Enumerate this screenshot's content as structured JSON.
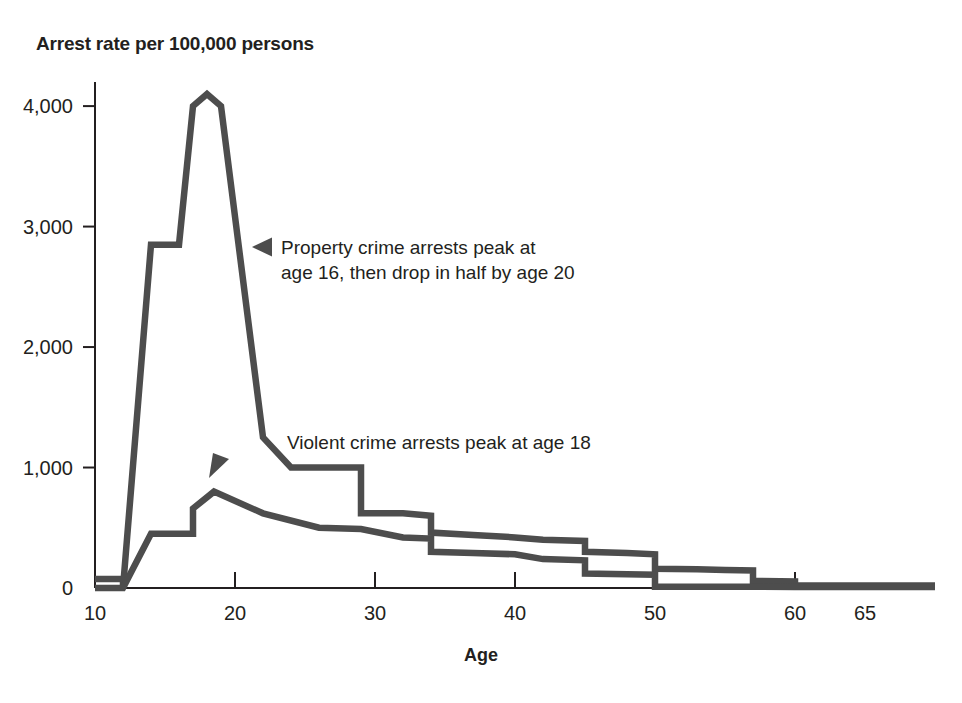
{
  "chart_data": {
    "type": "line",
    "title": "Arrest rate per 100,000 persons",
    "xlabel": "Age",
    "ylabel": "Arrest rate per 100,000 persons",
    "xlim": [
      10,
      70
    ],
    "ylim": [
      0,
      4200
    ],
    "grid": false,
    "legend": "none",
    "x_ticks": [
      10,
      20,
      30,
      40,
      50,
      60,
      65
    ],
    "x_tick_labels": [
      "10",
      "20",
      "30",
      "40",
      "50",
      "60",
      "65"
    ],
    "y_ticks": [
      0,
      1000,
      2000,
      3000,
      4000
    ],
    "y_tick_labels": [
      "0",
      "1,000",
      "2,000",
      "3,000",
      "4,000"
    ],
    "line_color": "#4d4d4d",
    "axis_color": "#231f20",
    "series": [
      {
        "name": "Property crime arrests",
        "x": [
          10,
          12,
          12,
          14,
          16,
          17,
          18,
          19,
          22,
          24,
          29,
          29,
          32,
          34,
          34,
          37,
          40,
          42,
          45,
          45,
          48,
          50,
          50,
          53,
          55,
          57,
          57,
          60,
          60,
          70
        ],
        "values": [
          75,
          75,
          0,
          2850,
          2850,
          4000,
          4100,
          4000,
          1250,
          1000,
          1000,
          620,
          620,
          600,
          460,
          440,
          420,
          400,
          390,
          300,
          290,
          280,
          160,
          155,
          150,
          145,
          60,
          55,
          20,
          20
        ]
      },
      {
        "name": "Violent crime arrests",
        "x": [
          10,
          12,
          14,
          16,
          17,
          17,
          18.5,
          22,
          26,
          29,
          32,
          34,
          34,
          37,
          40,
          42,
          45,
          45,
          48,
          50,
          50,
          57,
          60,
          70
        ],
        "values": [
          0,
          0,
          450,
          450,
          450,
          660,
          800,
          620,
          500,
          490,
          420,
          410,
          300,
          290,
          280,
          240,
          230,
          120,
          115,
          110,
          10,
          10,
          8,
          8
        ]
      }
    ],
    "annotations": [
      {
        "id": "property-annotation",
        "text_lines": [
          "Property crime arrests peak at",
          "age 16, then drop in half by age 20"
        ],
        "marker": "left-triangle",
        "marker_x": 252,
        "marker_y": 247,
        "text_x": 281,
        "text_y": 254
      },
      {
        "id": "violent-annotation",
        "text_lines": [
          "Violent crime arrests peak at age 18"
        ],
        "marker": "right-triangle",
        "marker_x": 209,
        "marker_y": 478,
        "text_x": 287,
        "text_y": 449
      }
    ]
  },
  "geometry": {
    "plot_left": 95,
    "plot_right": 935,
    "plot_top": 82,
    "plot_bottom": 588,
    "x_min": 10,
    "x_max": 70,
    "y_min": 0,
    "y_max": 4200
  }
}
